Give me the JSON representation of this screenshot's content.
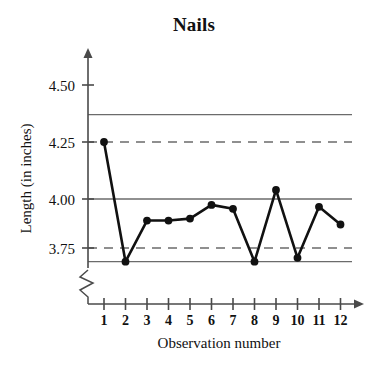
{
  "chart_data": {
    "type": "line",
    "title": "Nails",
    "xlabel": "Observation number",
    "ylabel": "Length (in inches)",
    "categories": [
      "1",
      "2",
      "3",
      "4",
      "5",
      "6",
      "7",
      "8",
      "9",
      "10",
      "11",
      "12"
    ],
    "x": [
      1,
      2,
      3,
      4,
      5,
      6,
      7,
      8,
      9,
      10,
      11,
      12
    ],
    "values": [
      4.25,
      3.68,
      3.89,
      3.89,
      3.9,
      3.97,
      3.95,
      3.68,
      4.04,
      3.7,
      3.96,
      3.87
    ],
    "series": [
      {
        "name": "Length (in inches)",
        "values": [
          4.25,
          3.68,
          3.89,
          3.89,
          3.9,
          3.97,
          3.95,
          3.68,
          4.04,
          3.7,
          3.96,
          3.87
        ]
      }
    ],
    "ytick_labels": [
      "4.50",
      "4.25",
      "4.00",
      "3.75"
    ],
    "ytick_values": [
      4.5,
      4.25,
      4.0,
      3.75
    ],
    "ylim": [
      3.63,
      4.62
    ],
    "xlim": [
      0.4,
      12.8
    ],
    "grid": false,
    "legend": false,
    "axis_break": true,
    "reference_lines": [
      {
        "name": "upper-control-limit",
        "value": 4.37,
        "style": "solid"
      },
      {
        "name": "upper-warning-limit",
        "value": 4.25,
        "style": "dashed"
      },
      {
        "name": "center-line",
        "value": 4.0,
        "style": "solid"
      },
      {
        "name": "lower-warning-limit",
        "value": 3.75,
        "style": "dashed"
      },
      {
        "name": "lower-control-limit",
        "value": 3.68,
        "style": "solid"
      }
    ],
    "marker": "filled-circle",
    "line_color": "#111111",
    "reference_line_color": "#6b6b6b",
    "background_color": "#ffffff"
  }
}
